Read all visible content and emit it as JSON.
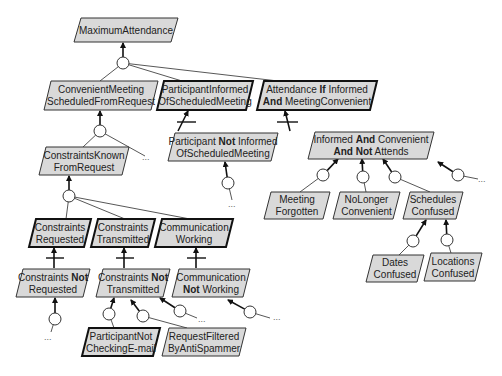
{
  "diagram": {
    "type": "goal-refinement-tree",
    "colors": {
      "node_fill": "#d9d9d9",
      "node_stroke": "#333333",
      "background": "#ffffff"
    },
    "ellipsis": "...",
    "nodes": [
      {
        "id": "maximum-attendance",
        "lines": [
          [
            {
              "t": "MaximumAttendance"
            }
          ]
        ],
        "x": 74,
        "y": 18,
        "w": 104,
        "h": 24,
        "thick": false
      },
      {
        "id": "convenient-meeting",
        "lines": [
          [
            {
              "t": "ConvenientMeeting"
            }
          ],
          [
            {
              "t": "ScheduledFromRequest"
            }
          ]
        ],
        "x": 44,
        "y": 81,
        "w": 114,
        "h": 29,
        "thick": false
      },
      {
        "id": "participant-informed",
        "lines": [
          [
            {
              "t": "ParticipantInformed"
            }
          ],
          [
            {
              "t": "OfScheduledMeeting"
            }
          ]
        ],
        "x": 157,
        "y": 81,
        "w": 96,
        "h": 29,
        "thick": true
      },
      {
        "id": "attendance-if-informed",
        "lines": [
          [
            {
              "t": "Attendance "
            },
            {
              "t": "If",
              "b": true
            },
            {
              "t": " Informed"
            }
          ],
          [
            {
              "t": "And",
              "b": true
            },
            {
              "t": " MeetingConvenient"
            }
          ]
        ],
        "x": 257,
        "y": 81,
        "w": 120,
        "h": 29,
        "thick": true
      },
      {
        "id": "participant-not-informed",
        "lines": [
          [
            {
              "t": "Participant "
            },
            {
              "t": "Not",
              "b": true
            },
            {
              "t": " Informed"
            }
          ],
          [
            {
              "t": "OfScheduledMeeting"
            }
          ]
        ],
        "x": 168,
        "y": 133,
        "w": 110,
        "h": 28,
        "thick": false
      },
      {
        "id": "informed-and-convenient",
        "lines": [
          [
            {
              "t": "Informed "
            },
            {
              "t": "And",
              "b": true
            },
            {
              "t": " Convenient"
            }
          ],
          [
            {
              "t": "And Not",
              "b": true
            },
            {
              "t": " Attends"
            }
          ]
        ],
        "x": 308,
        "y": 132,
        "w": 126,
        "h": 27,
        "thick": false
      },
      {
        "id": "constraints-known",
        "lines": [
          [
            {
              "t": "ConstraintsKnown"
            }
          ],
          [
            {
              "t": "FromRequest"
            }
          ]
        ],
        "x": 39,
        "y": 147,
        "w": 90,
        "h": 28,
        "thick": false
      },
      {
        "id": "meeting-forgotten",
        "lines": [
          [
            {
              "t": "Meeting"
            }
          ],
          [
            {
              "t": "Forgotten"
            }
          ]
        ],
        "x": 264,
        "y": 192,
        "w": 66,
        "h": 27,
        "thick": false
      },
      {
        "id": "no-longer-convenient",
        "lines": [
          [
            {
              "t": "NoLonger"
            }
          ],
          [
            {
              "t": "Convenient"
            }
          ]
        ],
        "x": 333,
        "y": 192,
        "w": 67,
        "h": 27,
        "thick": false
      },
      {
        "id": "schedules-confused",
        "lines": [
          [
            {
              "t": "Schedules"
            }
          ],
          [
            {
              "t": "Confused"
            }
          ]
        ],
        "x": 403,
        "y": 192,
        "w": 60,
        "h": 27,
        "thick": false
      },
      {
        "id": "constraints-requested",
        "lines": [
          [
            {
              "t": "Constraints"
            }
          ],
          [
            {
              "t": "Requested"
            }
          ]
        ],
        "x": 29,
        "y": 219,
        "w": 62,
        "h": 28,
        "thick": true
      },
      {
        "id": "constraints-transmitted",
        "lines": [
          [
            {
              "t": "Constraints"
            }
          ],
          [
            {
              "t": "Transmitted"
            }
          ]
        ],
        "x": 91,
        "y": 219,
        "w": 64,
        "h": 28,
        "thick": true
      },
      {
        "id": "communication-working",
        "lines": [
          [
            {
              "t": "Communication"
            }
          ],
          [
            {
              "t": "Working"
            }
          ]
        ],
        "x": 155,
        "y": 219,
        "w": 78,
        "h": 28,
        "thick": true
      },
      {
        "id": "dates-confused",
        "lines": [
          [
            {
              "t": "Dates"
            }
          ],
          [
            {
              "t": "Confused"
            }
          ]
        ],
        "x": 366,
        "y": 255,
        "w": 58,
        "h": 27,
        "thick": false
      },
      {
        "id": "locations-confused",
        "lines": [
          [
            {
              "t": "Locations"
            }
          ],
          [
            {
              "t": "Confused"
            }
          ]
        ],
        "x": 424,
        "y": 253,
        "w": 58,
        "h": 28,
        "thick": false
      },
      {
        "id": "constraints-not-requested",
        "lines": [
          [
            {
              "t": "Constraints "
            },
            {
              "t": "Not",
              "b": true
            }
          ],
          [
            {
              "t": "Requested"
            }
          ]
        ],
        "x": 16,
        "y": 269,
        "w": 74,
        "h": 28,
        "thick": false
      },
      {
        "id": "constraints-not-transmitted",
        "lines": [
          [
            {
              "t": "Constraints "
            },
            {
              "t": "Not",
              "b": true
            }
          ],
          [
            {
              "t": "Transmitted"
            }
          ]
        ],
        "x": 96,
        "y": 269,
        "w": 74,
        "h": 28,
        "thick": false
      },
      {
        "id": "communication-not-working",
        "lines": [
          [
            {
              "t": "Communication"
            }
          ],
          [
            {
              "t": "Not",
              "b": true
            },
            {
              "t": " Working"
            }
          ]
        ],
        "x": 172,
        "y": 269,
        "w": 78,
        "h": 28,
        "thick": false
      },
      {
        "id": "participant-not-checking-email",
        "lines": [
          [
            {
              "t": "ParticipantNot"
            }
          ],
          [
            {
              "t": "CheckingE-mail"
            }
          ]
        ],
        "x": 82,
        "y": 328,
        "w": 78,
        "h": 28,
        "thick": true
      },
      {
        "id": "request-filtered-by-antispammer",
        "lines": [
          [
            {
              "t": "RequestFiltered"
            }
          ],
          [
            {
              "t": "ByAntiSpammer"
            }
          ]
        ],
        "x": 162,
        "y": 328,
        "w": 84,
        "h": 28,
        "thick": false
      }
    ],
    "refinements": [
      {
        "circle": [
          123,
          63
        ],
        "target": [
          123,
          43
        ],
        "children": [
          [
            100,
            81
          ],
          [
            182,
            81
          ],
          [
            278,
            81
          ]
        ],
        "ellipsis": null
      },
      {
        "circle": [
          100,
          131
        ],
        "target": [
          100,
          111
        ],
        "children": [
          [
            83,
            147
          ]
        ],
        "dangling": [
          [
            145,
            156
          ]
        ],
        "ellipsis": [
          142,
          160
        ]
      },
      {
        "circle": [
          69,
          196
        ],
        "target": [
          69,
          176
        ],
        "children": [
          [
            66,
            219
          ],
          [
            125,
            219
          ],
          [
            190,
            219
          ]
        ],
        "ellipsis": null
      },
      {
        "circle": [
          228,
          183
        ],
        "target": [
          225,
          162
        ],
        "children": [],
        "dangling": [
          [
            232,
            200
          ]
        ],
        "ellipsis": [
          228,
          207
        ]
      },
      {
        "circle": [
          323,
          175
        ],
        "target": [
          338,
          159
        ],
        "children": [
          [
            300,
            192
          ]
        ],
        "ellipsis": null
      },
      {
        "circle": [
          363,
          177
        ],
        "target": [
          362,
          159
        ],
        "children": [
          [
            366,
            192
          ]
        ],
        "ellipsis": null
      },
      {
        "circle": [
          395,
          177
        ],
        "target": [
          383,
          159
        ],
        "children": [
          [
            430,
            192
          ]
        ],
        "ellipsis": null
      },
      {
        "circle": [
          458,
          175
        ],
        "target": [
          438,
          162
        ],
        "children": [],
        "dangling": [
          [
            478,
            179
          ]
        ],
        "ellipsis": [
          478,
          182
        ]
      },
      {
        "circle": [
          413,
          241
        ],
        "target": [
          426,
          220
        ],
        "children": [
          [
            399,
            255
          ]
        ],
        "ellipsis": null
      },
      {
        "circle": [
          447,
          240
        ],
        "target": [
          446,
          220
        ],
        "children": [
          [
            451,
            253
          ]
        ],
        "ellipsis": null
      },
      {
        "circle": [
          55,
          319
        ],
        "target": [
          55,
          298
        ],
        "children": [],
        "dangling": [
          [
            51,
            332
          ]
        ],
        "ellipsis": [
          44,
          340
        ]
      },
      {
        "circle": [
          109,
          314
        ],
        "target": [
          114,
          298
        ],
        "children": [
          [
            114,
            328
          ]
        ],
        "ellipsis": null
      },
      {
        "circle": [
          143,
          316
        ],
        "target": [
          131,
          300
        ],
        "children": [
          [
            187,
            328
          ]
        ],
        "ellipsis": null
      },
      {
        "circle": [
          180,
          311
        ],
        "target": [
          160,
          298
        ],
        "children": [],
        "dangling": [
          [
            197,
            318
          ]
        ],
        "ellipsis": [
          198,
          322
        ]
      },
      {
        "circle": [
          250,
          312
        ],
        "target": [
          228,
          300
        ],
        "children": [],
        "dangling": [
          [
            270,
            318
          ]
        ],
        "ellipsis": [
          273,
          320
        ]
      }
    ],
    "obstructions": [
      {
        "from": [
          178,
          131
        ],
        "to": [
          188,
          111
        ],
        "bar": [
          177,
          122,
          196,
          122
        ]
      },
      {
        "from": [
          290,
          131
        ],
        "to": [
          285,
          111
        ],
        "bar": [
          277,
          122,
          298,
          122
        ]
      },
      {
        "from": [
          54,
          268
        ],
        "to": [
          54,
          248
        ],
        "bar": [
          46,
          258,
          64,
          258
        ]
      },
      {
        "from": [
          124,
          268
        ],
        "to": [
          124,
          248
        ],
        "bar": [
          116,
          258,
          134,
          258
        ]
      },
      {
        "from": [
          196,
          268
        ],
        "to": [
          196,
          248
        ],
        "bar": [
          187,
          258,
          206,
          258
        ]
      }
    ]
  }
}
